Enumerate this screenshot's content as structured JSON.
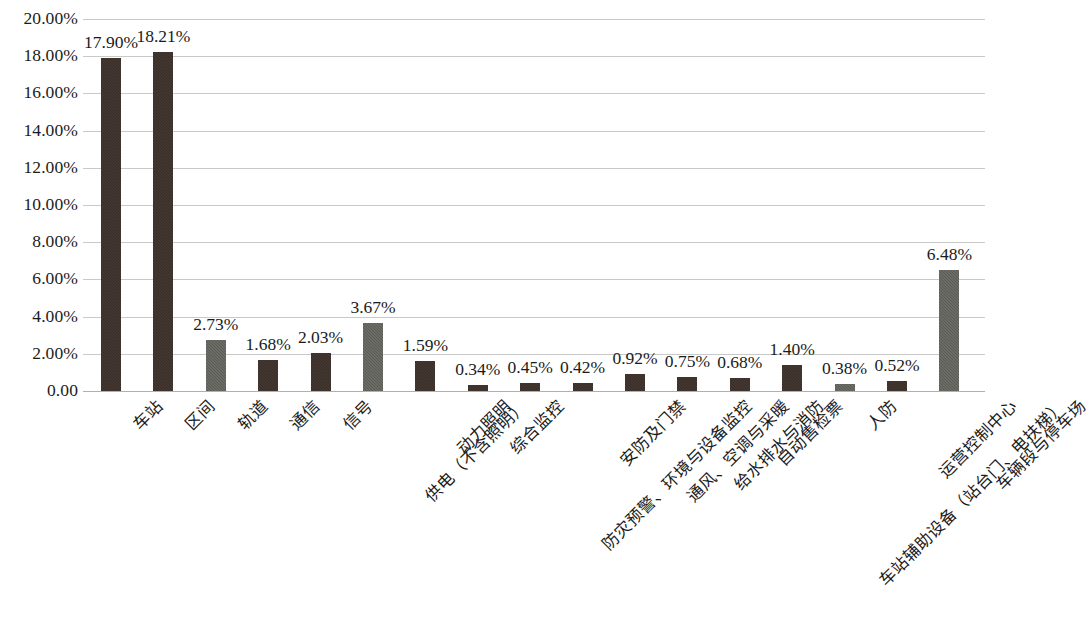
{
  "chart_data": {
    "type": "bar",
    "title": "",
    "subtitle": "",
    "xlabel": "",
    "ylabel": "",
    "ylim": [
      0,
      20
    ],
    "grid": true,
    "legend": "none",
    "y_ticks": [
      {
        "value": 0,
        "label": "0.00"
      },
      {
        "value": 2,
        "label": "2.00%"
      },
      {
        "value": 4,
        "label": "4.00%"
      },
      {
        "value": 6,
        "label": "6.00%"
      },
      {
        "value": 8,
        "label": "8.00%"
      },
      {
        "value": 10,
        "label": "10.00%"
      },
      {
        "value": 12,
        "label": "12.00%"
      },
      {
        "value": 14,
        "label": "14.00%"
      },
      {
        "value": 16,
        "label": "16.00%"
      },
      {
        "value": 18,
        "label": "18.00%"
      },
      {
        "value": 20,
        "label": "20.00%"
      }
    ],
    "categories": [
      "车站",
      "区间",
      "轨道",
      "通信",
      "信号",
      "供电（不含照明）",
      "动力照明",
      "综合监控",
      "防灾预警、环境与设备监控",
      "安防及门禁",
      "通风、空调与采暖",
      "给水排水与消防",
      "自动售检票",
      "车站辅助设备（站台门、电扶梯）",
      "人防",
      "运营控制中心",
      "车辆段与停车场"
    ],
    "values": [
      17.9,
      18.21,
      2.73,
      1.68,
      2.03,
      3.67,
      1.59,
      0.34,
      0.45,
      0.42,
      0.92,
      0.75,
      0.68,
      1.4,
      0.38,
      0.52,
      6.48
    ],
    "value_labels": [
      "17.90%",
      "18.21%",
      "2.73%",
      "1.68%",
      "2.03%",
      "3.67%",
      "1.59%",
      "0.34%",
      "0.45%",
      "0.42%",
      "0.92%",
      "0.75%",
      "0.68%",
      "1.40%",
      "0.38%",
      "0.52%",
      "6.48%"
    ],
    "bar_colors": [
      "#392c26",
      "#392c26",
      "#5b5b56",
      "#392c26",
      "#392c26",
      "#5b5b56",
      "#392c26",
      "#392c26",
      "#392c26",
      "#392c26",
      "#392c26",
      "#392c26",
      "#392c26",
      "#392c26",
      "#5b5b56",
      "#392c26",
      "#5b5b56"
    ],
    "palette": {
      "dark": "#392c26",
      "gray": "#5b5b56",
      "gridline": "#c9c9c9",
      "text": "#1b1b1b",
      "background": "#ffffff"
    }
  }
}
